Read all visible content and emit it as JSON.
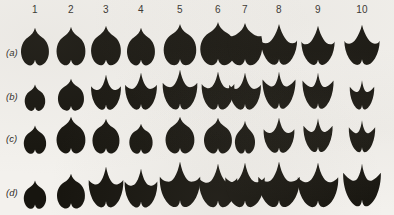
{
  "figure": {
    "background_color": "#f3f1ed",
    "ink_color": "#17150f",
    "column_headers": [
      "1",
      "2",
      "3",
      "4",
      "5",
      "6",
      "7",
      "8",
      "9",
      "10"
    ],
    "row_labels": [
      "(a)",
      "(b)",
      "(c)",
      "(d)"
    ]
  },
  "chart_data": {
    "type": "table",
    "title": "",
    "xlabel": "",
    "ylabel": "",
    "categories": [
      "1",
      "2",
      "3",
      "4",
      "5",
      "6",
      "7",
      "8",
      "9",
      "10"
    ],
    "row_names": [
      "(a)",
      "(b)",
      "(c)",
      "(d)"
    ],
    "series": [
      {
        "name": "(a)",
        "values": [
          {
            "col": "1",
            "lobes": 1,
            "width": 30,
            "height": 40,
            "form": "cordate-entire"
          },
          {
            "col": "2",
            "lobes": 1,
            "width": 31,
            "height": 41,
            "form": "cordate-entire"
          },
          {
            "col": "3",
            "lobes": 1,
            "width": 32,
            "height": 42,
            "form": "cordate-entire"
          },
          {
            "col": "4",
            "lobes": 1,
            "width": 30,
            "height": 40,
            "form": "cordate-entire"
          },
          {
            "col": "5",
            "lobes": 1,
            "width": 35,
            "height": 44,
            "form": "cordate-entire"
          },
          {
            "col": "6",
            "lobes": 1,
            "width": 38,
            "height": 46,
            "form": "cordate-entire"
          },
          {
            "col": "7",
            "lobes": 1,
            "width": 38,
            "height": 45,
            "form": "cordate-shouldered"
          },
          {
            "col": "8",
            "lobes": 3,
            "width": 37,
            "height": 44,
            "form": "shallow-trilobed"
          },
          {
            "col": "9",
            "lobes": 3,
            "width": 34,
            "height": 42,
            "form": "shallow-trilobed"
          },
          {
            "col": "10",
            "lobes": 3,
            "width": 36,
            "height": 43,
            "form": "shallow-trilobed"
          }
        ]
      },
      {
        "name": "(b)",
        "values": [
          {
            "col": "1",
            "lobes": 1,
            "width": 22,
            "height": 28,
            "form": "cordate-entire"
          },
          {
            "col": "2",
            "lobes": 1,
            "width": 28,
            "height": 34,
            "form": "cordate-entire"
          },
          {
            "col": "3",
            "lobes": 3,
            "width": 31,
            "height": 38,
            "form": "trilobed"
          },
          {
            "col": "4",
            "lobes": 3,
            "width": 33,
            "height": 40,
            "form": "trilobed"
          },
          {
            "col": "5",
            "lobes": 3,
            "width": 36,
            "height": 43,
            "form": "trilobed"
          },
          {
            "col": "6",
            "lobes": 3,
            "width": 34,
            "height": 41,
            "form": "trilobed"
          },
          {
            "col": "7",
            "lobes": 3,
            "width": 33,
            "height": 40,
            "form": "trilobed"
          },
          {
            "col": "8",
            "lobes": 3,
            "width": 35,
            "height": 41,
            "form": "deep-trilobed"
          },
          {
            "col": "9",
            "lobes": 3,
            "width": 33,
            "height": 40,
            "form": "deep-trilobed"
          },
          {
            "col": "10",
            "lobes": 3,
            "width": 26,
            "height": 32,
            "form": "deep-trilobed"
          }
        ]
      },
      {
        "name": "(c)",
        "values": [
          {
            "col": "1",
            "lobes": 1,
            "width": 24,
            "height": 30,
            "form": "cordate-entire"
          },
          {
            "col": "2",
            "lobes": 1,
            "width": 31,
            "height": 39,
            "form": "cordate-entire"
          },
          {
            "col": "3",
            "lobes": 1,
            "width": 29,
            "height": 37,
            "form": "cordate-entire"
          },
          {
            "col": "4",
            "lobes": 1,
            "width": 25,
            "height": 32,
            "form": "cordate-entire"
          },
          {
            "col": "5",
            "lobes": 1,
            "width": 31,
            "height": 39,
            "form": "cordate-entire"
          },
          {
            "col": "6",
            "lobes": 1,
            "width": 30,
            "height": 38,
            "form": "cordate-entire"
          },
          {
            "col": "7",
            "lobes": 1,
            "width": 26,
            "height": 35,
            "form": "cordate-narrow"
          },
          {
            "col": "8",
            "lobes": 3,
            "width": 32,
            "height": 38,
            "form": "trilobed"
          },
          {
            "col": "9",
            "lobes": 3,
            "width": 31,
            "height": 37,
            "form": "deep-trilobed"
          },
          {
            "col": "10",
            "lobes": 3,
            "width": 28,
            "height": 35,
            "form": "deep-trilobed"
          }
        ]
      },
      {
        "name": "(d)",
        "values": [
          {
            "col": "1",
            "lobes": 1,
            "width": 24,
            "height": 30,
            "form": "cordate-entire"
          },
          {
            "col": "2",
            "lobes": 1,
            "width": 30,
            "height": 37,
            "form": "cordate-entire"
          },
          {
            "col": "3",
            "lobes": 3,
            "width": 36,
            "height": 44,
            "form": "trilobed"
          },
          {
            "col": "4",
            "lobes": 3,
            "width": 34,
            "height": 42,
            "form": "trilobed"
          },
          {
            "col": "5",
            "lobes": 3,
            "width": 42,
            "height": 49,
            "form": "trilobed"
          },
          {
            "col": "6",
            "lobes": 3,
            "width": 40,
            "height": 47,
            "form": "trilobed"
          },
          {
            "col": "7",
            "lobes": 3,
            "width": 41,
            "height": 48,
            "form": "trilobed"
          },
          {
            "col": "8",
            "lobes": 3,
            "width": 43,
            "height": 49,
            "form": "trilobed"
          },
          {
            "col": "9",
            "lobes": 3,
            "width": 42,
            "height": 48,
            "form": "trilobed"
          },
          {
            "col": "10",
            "lobes": 3,
            "width": 40,
            "height": 47,
            "form": "deep-trilobed"
          }
        ]
      }
    ],
    "column_x": [
      35,
      71,
      106,
      141,
      180,
      218,
      245,
      279,
      318,
      362
    ],
    "row_baseline_y": [
      67,
      112,
      155,
      210
    ],
    "row_label_y": [
      52,
      96,
      138,
      192
    ],
    "grid": false,
    "legend_position": "none"
  }
}
